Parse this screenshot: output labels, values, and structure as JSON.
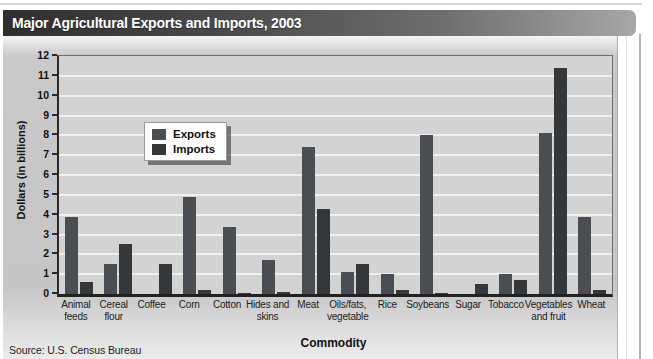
{
  "title": "Major Agricultural Exports and Imports, 2003",
  "source": "Source: U.S. Census Bureau",
  "legend": {
    "exports_label": "Exports",
    "imports_label": "Imports"
  },
  "colors": {
    "exports": "#4a4e52",
    "imports": "#34383b",
    "titlebar_start": "#2e2e2e",
    "titlebar_end": "#a7a7a7",
    "panel_bg": "#c6c6c6",
    "plot_bg": "#d3d3d3",
    "gridline": "#f1f1f1",
    "axis": "#222222"
  },
  "chart_data": {
    "type": "bar",
    "title": "Major Agricultural Exports and Imports, 2003",
    "xlabel": "Commodity",
    "ylabel": "Dollars (in billions)",
    "ylim": [
      0,
      12
    ],
    "ytick_step": 1,
    "grid": "horizontal white gridlines at each unit",
    "legend_position": "upper left inside plot",
    "categories": [
      "Animal feeds",
      "Cereal flour",
      "Coffee",
      "Corn",
      "Cotton",
      "Hides and skins",
      "Meat",
      "Oils/fats, vegetable",
      "Rice",
      "Soybeans",
      "Sugar",
      "Tobacco",
      "Vegetables and fruit",
      "Wheat"
    ],
    "category_labels": [
      "Animal\nfeeds",
      "Cereal\nflour",
      "Coffee",
      "Corn",
      "Cotton",
      "Hides and\nskins",
      "Meat",
      "Oils/fats,\nvegetable",
      "Rice",
      "Soybeans",
      "Sugar",
      "Tobacco",
      "Vegetables\nand fruit",
      "Wheat"
    ],
    "series": [
      {
        "name": "Exports",
        "values": [
          3.9,
          1.5,
          0,
          4.9,
          3.4,
          1.7,
          7.4,
          1.1,
          1.0,
          8.0,
          0,
          1.0,
          8.1,
          3.9
        ]
      },
      {
        "name": "Imports",
        "values": [
          0.6,
          2.5,
          1.5,
          0.2,
          0.05,
          0.1,
          4.3,
          1.5,
          0.2,
          0.05,
          0.5,
          0.7,
          11.4,
          0.2
        ]
      }
    ]
  }
}
